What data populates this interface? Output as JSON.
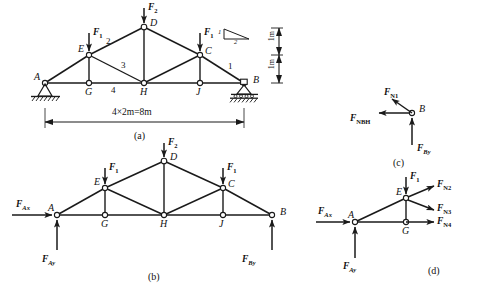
{
  "figure": {
    "stroke_color": "#1a1a1a",
    "fill_color": "#ffffff",
    "background": "#ffffff"
  },
  "panel_a": {
    "caption": "(a)",
    "nodes": [
      {
        "id": "A",
        "label": "A"
      },
      {
        "id": "E",
        "label": "E"
      },
      {
        "id": "D",
        "label": "D"
      },
      {
        "id": "C",
        "label": "C"
      },
      {
        "id": "B",
        "label": "B"
      },
      {
        "id": "G",
        "label": "G"
      },
      {
        "id": "H",
        "label": "H"
      },
      {
        "id": "J",
        "label": "J"
      }
    ],
    "members": [
      {
        "id": "1",
        "label": "1"
      },
      {
        "id": "2",
        "label": "2"
      },
      {
        "id": "3",
        "label": "3"
      },
      {
        "id": "4",
        "label": "4"
      }
    ],
    "loads": [
      {
        "id": "F1-left",
        "label": "F",
        "sub": "1"
      },
      {
        "id": "F2-top",
        "label": "F",
        "sub": "2"
      },
      {
        "id": "F1-right",
        "label": "F",
        "sub": "1"
      }
    ],
    "span_dimension": "4×2m=8m",
    "height_dimension_upper": "1m",
    "height_dimension_lower": "1m",
    "slope_rise": "1",
    "slope_run": "2",
    "support_a_type": "pin-support",
    "support_b_type": "roller-support"
  },
  "panel_b": {
    "caption": "(b)",
    "nodes": [
      {
        "id": "A",
        "label": "A"
      },
      {
        "id": "E",
        "label": "E"
      },
      {
        "id": "D",
        "label": "D"
      },
      {
        "id": "C",
        "label": "C"
      },
      {
        "id": "B",
        "label": "B"
      },
      {
        "id": "G",
        "label": "G"
      },
      {
        "id": "H",
        "label": "H"
      },
      {
        "id": "J",
        "label": "J"
      }
    ],
    "forces": [
      {
        "id": "FAx",
        "label": "F",
        "sub": "Ax"
      },
      {
        "id": "FAy",
        "label": "F",
        "sub": "Ay"
      },
      {
        "id": "FBy",
        "label": "F",
        "sub": "By"
      },
      {
        "id": "F1-left",
        "label": "F",
        "sub": "1"
      },
      {
        "id": "F2-top",
        "label": "F",
        "sub": "2"
      },
      {
        "id": "F1-right",
        "label": "F",
        "sub": "1"
      }
    ]
  },
  "panel_c": {
    "caption": "(c)",
    "node_label": "B",
    "forces": [
      {
        "id": "FN1",
        "label": "F",
        "sub": "N1"
      },
      {
        "id": "FNBH",
        "label": "F",
        "sub": "NBH"
      },
      {
        "id": "FBy",
        "label": "F",
        "sub": "By"
      }
    ]
  },
  "panel_d": {
    "caption": "(d)",
    "nodes": [
      {
        "id": "A",
        "label": "A"
      },
      {
        "id": "E",
        "label": "E"
      },
      {
        "id": "G",
        "label": "G"
      }
    ],
    "forces": [
      {
        "id": "FAx",
        "label": "F",
        "sub": "Ax"
      },
      {
        "id": "FAy",
        "label": "F",
        "sub": "Ay"
      },
      {
        "id": "F1",
        "label": "F",
        "sub": "1"
      },
      {
        "id": "FN2",
        "label": "F",
        "sub": "N2"
      },
      {
        "id": "FN3",
        "label": "F",
        "sub": "N3"
      },
      {
        "id": "FN4",
        "label": "F",
        "sub": "N4"
      }
    ]
  }
}
